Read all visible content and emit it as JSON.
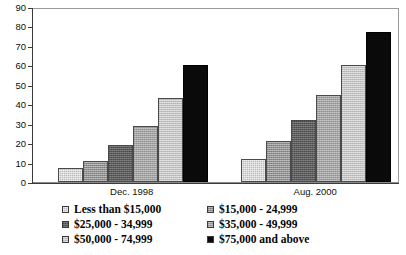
{
  "chart_data": {
    "type": "bar",
    "title": "",
    "xlabel": "",
    "ylabel": "",
    "ylim": [
      0,
      90
    ],
    "ytick_labels": [
      "90",
      "80",
      "70",
      "60",
      "50",
      "40",
      "30",
      "20",
      "10",
      "0"
    ],
    "ytick_values": [
      90,
      80,
      70,
      60,
      50,
      40,
      30,
      20,
      10,
      0
    ],
    "grid": false,
    "legend_position": "bottom",
    "categories": [
      "Dec. 1998",
      "Aug. 2000"
    ],
    "series": [
      {
        "name": "Less than $15,000",
        "values": [
          7,
          12
        ],
        "swatch": "lightgray"
      },
      {
        "name": "$15,000 - 24,999",
        "values": [
          11,
          21
        ],
        "swatch": "medgray"
      },
      {
        "name": "$25,000 - 34,999",
        "values": [
          19,
          32
        ],
        "swatch": "darkgray"
      },
      {
        "name": "$35,000 - 49,999",
        "values": [
          29,
          45
        ],
        "swatch": "midgray"
      },
      {
        "name": "$50,000 - 74,999",
        "values": [
          43,
          60
        ],
        "swatch": "palegray"
      },
      {
        "name": "$75,000 and above",
        "values": [
          60,
          77
        ],
        "swatch": "black"
      }
    ]
  },
  "axis": {
    "ticks": [
      {
        "label": "90",
        "value": 90
      },
      {
        "label": "80",
        "value": 80
      },
      {
        "label": "70",
        "value": 70
      },
      {
        "label": "60",
        "value": 60
      },
      {
        "label": "50",
        "value": 50
      },
      {
        "label": "40",
        "value": 40
      },
      {
        "label": "30",
        "value": 30
      },
      {
        "label": "20",
        "value": 20
      },
      {
        "label": "10",
        "value": 10
      },
      {
        "label": "0",
        "value": 0
      }
    ]
  },
  "groups": [
    {
      "label": "Dec. 1998"
    },
    {
      "label": "Aug. 2000"
    }
  ],
  "legend": {
    "left_column": [
      {
        "label": "Less than $15,000",
        "swatch": "lightgray"
      },
      {
        "label": "$25,000 - 34,999",
        "swatch": "darkgray"
      },
      {
        "label": "$50,000 - 74,999",
        "swatch": "palegray"
      }
    ],
    "right_column": [
      {
        "label": "$15,000 - 24,999",
        "swatch": "medgray"
      },
      {
        "label": "$35,000 - 49,999",
        "swatch": "midgray"
      },
      {
        "label": "$75,000 and above",
        "swatch": "black"
      }
    ]
  },
  "colors": {
    "lightgray": "#b9b9b9",
    "medgray": "#8f8f8f",
    "darkgray": "#5c5c5c",
    "midgray": "#a2a2a2",
    "palegray": "#c2c2c2",
    "black": "#0a0a0a",
    "axis": "#3b3b3b",
    "frame": "#8a8a8a",
    "background": "#ffffff"
  }
}
